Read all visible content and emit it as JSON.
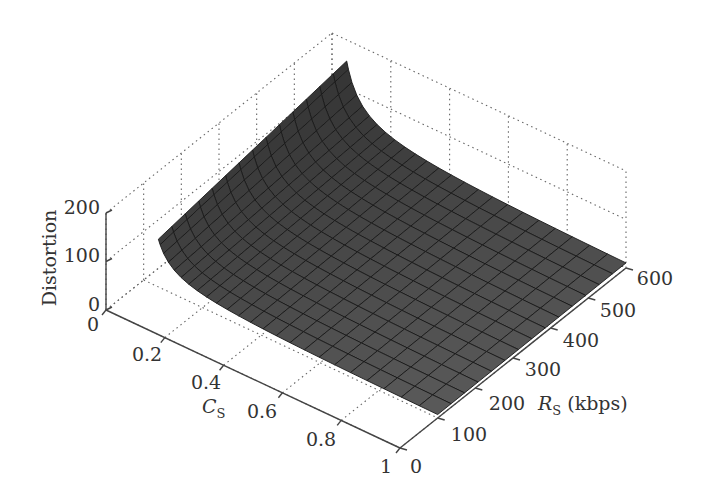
{
  "chart_data": {
    "type": "surface3d",
    "title": "",
    "xlabel": "C_s",
    "ylabel": "R_s (kbps)",
    "zlabel": "Distortion",
    "x_axis": {
      "name": "C_s",
      "range": [
        0,
        1
      ],
      "ticks": [
        "0",
        "0.2",
        "0.4",
        "0.6",
        "0.8",
        "1"
      ]
    },
    "y_axis": {
      "name": "R_s (kbps)",
      "range": [
        0,
        600
      ],
      "ticks": [
        "0",
        "100",
        "200",
        "300",
        "400",
        "500",
        "600"
      ]
    },
    "z_axis": {
      "name": "Distortion",
      "range": [
        0,
        200
      ],
      "ticks": [
        "0",
        "100",
        "200"
      ]
    },
    "grid": true,
    "surface": {
      "x_range": [
        0.05,
        1.0
      ],
      "y_range": [
        100,
        600
      ],
      "description": "Distortion surface decreasing with R_s and increasing sharply near C_s -> 0; flattens to near 0 for large C_s",
      "corner_values": {
        "Cs_0.05_Rs_100": 100,
        "Cs_0.05_Rs_600": 150,
        "Cs_1_Rs_100": 5,
        "Cs_1_Rs_600": 2
      },
      "color": "#505050",
      "mesh_color": "#1a1a1a"
    }
  },
  "labels": {
    "z_title": "Distortion",
    "x_title_main": "C",
    "x_title_sub": "S",
    "y_title_main": "R",
    "y_title_sub": "S",
    "y_title_unit": " (kbps)",
    "z_ticks": [
      "200",
      "100",
      "0"
    ],
    "x_ticks": [
      "0",
      "0.2",
      "0.4",
      "0.6",
      "0.8",
      "1"
    ],
    "y_ticks": [
      "0",
      "100",
      "200",
      "300",
      "400",
      "500",
      "600"
    ]
  }
}
